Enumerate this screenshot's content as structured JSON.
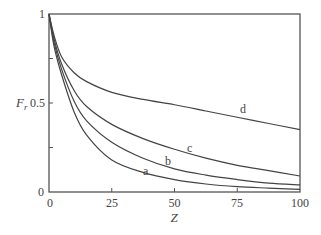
{
  "chart_data": {
    "type": "line",
    "title": "",
    "xlabel": "Z",
    "ylabel": "F_r",
    "xlim": [
      0,
      100
    ],
    "ylim": [
      0,
      1
    ],
    "grid": false,
    "legend": "inline curve labels",
    "x_ticks": [
      "0",
      "25",
      "50",
      "75",
      "100"
    ],
    "y_ticks": [
      "0",
      "0.5",
      "1"
    ],
    "x": [
      0,
      2,
      5,
      10,
      15,
      25,
      37.5,
      50,
      62.5,
      75,
      87.5,
      100
    ],
    "series": [
      {
        "name": "a",
        "values": [
          1.0,
          0.82,
          0.66,
          0.45,
          0.32,
          0.18,
          0.11,
          0.07,
          0.045,
          0.03,
          0.022,
          0.015
        ]
      },
      {
        "name": "b",
        "values": [
          1.0,
          0.84,
          0.69,
          0.51,
          0.4,
          0.28,
          0.19,
          0.13,
          0.095,
          0.07,
          0.05,
          0.04
        ]
      },
      {
        "name": "c",
        "values": [
          1.0,
          0.86,
          0.72,
          0.57,
          0.48,
          0.38,
          0.3,
          0.24,
          0.19,
          0.15,
          0.12,
          0.09
        ]
      },
      {
        "name": "d",
        "values": [
          1.0,
          0.88,
          0.76,
          0.67,
          0.62,
          0.56,
          0.52,
          0.49,
          0.455,
          0.42,
          0.385,
          0.35
        ]
      }
    ],
    "annotations": [
      {
        "text": "a",
        "x": 38,
        "y": 0.11
      },
      {
        "text": "b",
        "x": 47,
        "y": 0.17
      },
      {
        "text": "c",
        "x": 56,
        "y": 0.24
      },
      {
        "text": "d",
        "x": 77,
        "y": 0.46
      }
    ]
  },
  "axes": {
    "x_title": "Z",
    "y_title_main": "F",
    "y_title_sub": "r",
    "x_tick_labels": [
      "0",
      "25",
      "50",
      "75",
      "100"
    ],
    "y_tick_labels": [
      "0",
      "0.5",
      "1"
    ]
  },
  "labels": {
    "a": "a",
    "b": "b",
    "c": "c",
    "d": "d"
  },
  "colors": {
    "line": "#444444",
    "axis": "#555555"
  }
}
